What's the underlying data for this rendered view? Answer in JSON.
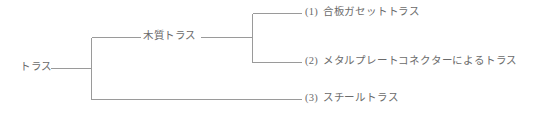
{
  "diagram": {
    "type": "tree-classification-diagram",
    "line_color": "#9a9a9a",
    "text_color": "#6b6b6b",
    "root": {
      "label": "トラス"
    },
    "branches": [
      {
        "label": "木質トラス",
        "children": [
          {
            "index": "(1)",
            "label": "合板ガセットトラス"
          },
          {
            "index": "(2)",
            "label": "メタルプレートコネクターによるトラス"
          }
        ]
      },
      {
        "label": "",
        "children": [
          {
            "index": "(3)",
            "label": "スチールトラス"
          }
        ]
      }
    ],
    "leaves": [
      {
        "index": "(1)",
        "label": "合板ガセットトラス"
      },
      {
        "index": "(2)",
        "label": "メタルプレートコネクターによるトラス"
      },
      {
        "index": "(3)",
        "label": "スチールトラス"
      }
    ]
  }
}
